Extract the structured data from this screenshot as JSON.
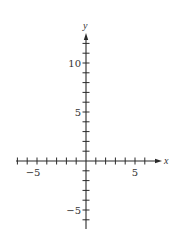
{
  "figure": {
    "type": "cartesian-axes",
    "x_axis": {
      "label": "x",
      "range_shown": [
        -7,
        7.5
      ],
      "ticks": [
        -7,
        -6,
        -5,
        -4,
        -3,
        -2,
        -1,
        1,
        2,
        3,
        4,
        5,
        6
      ],
      "tick_labels": [
        {
          "value": -5,
          "text": "−5"
        },
        {
          "value": 5,
          "text": "5"
        }
      ],
      "arrow": "positive"
    },
    "y_axis": {
      "label": "y",
      "range_shown": [
        -7,
        13
      ],
      "ticks": [
        -6,
        -5,
        -4,
        -3,
        -2,
        -1,
        1,
        2,
        3,
        4,
        5,
        6,
        7,
        8,
        9,
        10,
        11,
        12
      ],
      "tick_labels": [
        {
          "value": 10,
          "text": "10"
        },
        {
          "value": 5,
          "text": "5"
        },
        {
          "value": -5,
          "text": "−5"
        }
      ],
      "arrow": "positive"
    },
    "colors": {
      "background": "#ffffff",
      "axis": "#2a2a2a",
      "text": "#333333"
    }
  }
}
